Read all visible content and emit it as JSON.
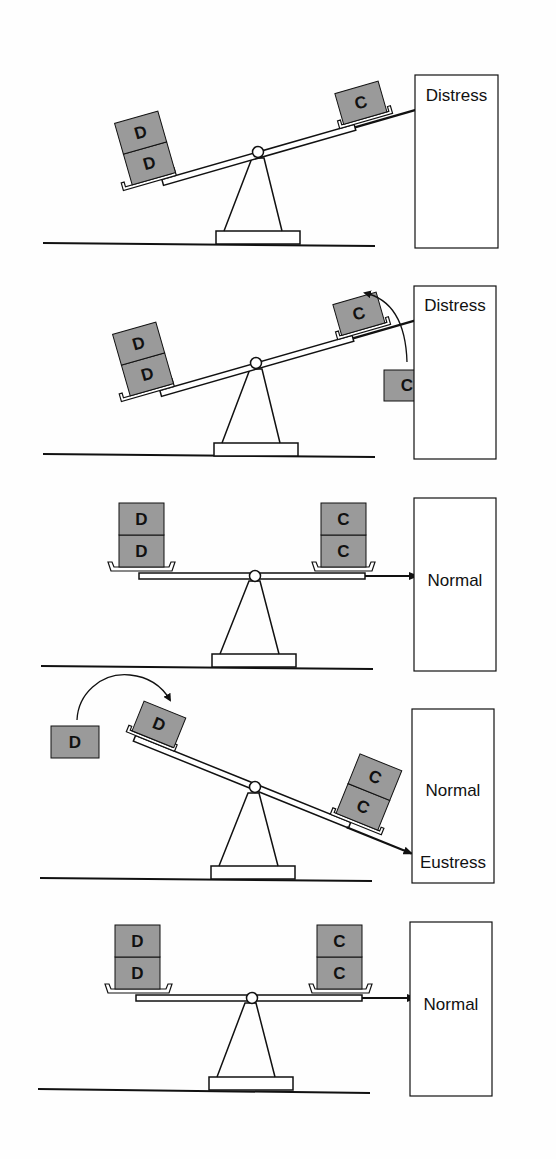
{
  "diagram": {
    "title": "",
    "colors": {
      "block_fill": "#9a9a9a",
      "line": "#111111",
      "background": "#fefefe"
    },
    "block_letters": {
      "demand": "D",
      "coping": "C"
    },
    "panels": [
      {
        "id": 1,
        "state_label": "Distress",
        "state_label_secondary": "",
        "left_blocks": [
          "D",
          "D"
        ],
        "right_blocks": [
          "C"
        ],
        "tilt": "left-down",
        "moving_block": null
      },
      {
        "id": 2,
        "state_label": "Distress",
        "state_label_secondary": "",
        "left_blocks": [
          "D",
          "D"
        ],
        "right_blocks": [
          "C"
        ],
        "tilt": "left-down",
        "moving_block": {
          "letter": "C",
          "direction": "onto right pan"
        }
      },
      {
        "id": 3,
        "state_label": "Normal",
        "state_label_secondary": "",
        "left_blocks": [
          "D",
          "D"
        ],
        "right_blocks": [
          "C",
          "C"
        ],
        "tilt": "level",
        "moving_block": null
      },
      {
        "id": 4,
        "state_label": "Normal",
        "state_label_secondary": "Eustress",
        "left_blocks": [
          "D"
        ],
        "right_blocks": [
          "C",
          "C"
        ],
        "tilt": "right-down",
        "moving_block": {
          "letter": "D",
          "direction": "onto left pan"
        }
      },
      {
        "id": 5,
        "state_label": "Normal",
        "state_label_secondary": "",
        "left_blocks": [
          "D",
          "D"
        ],
        "right_blocks": [
          "C",
          "C"
        ],
        "tilt": "level",
        "moving_block": null
      }
    ]
  }
}
